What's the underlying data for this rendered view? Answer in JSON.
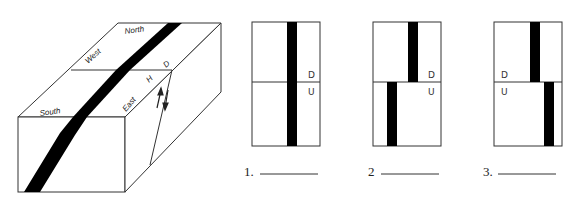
{
  "block_diagram": {
    "labels": {
      "north": "North",
      "west": "West",
      "south": "South",
      "east": "East",
      "fault_upper": "D",
      "fault_lower": "H"
    },
    "motion_arrows": [
      "up",
      "down"
    ]
  },
  "panels": [
    {
      "number": "1.",
      "top_label": "D",
      "bottom_label": "U",
      "label_side": "right",
      "offset": "none",
      "answer": ""
    },
    {
      "number": "2",
      "top_label": "D",
      "bottom_label": "U",
      "label_side": "right",
      "offset": "left",
      "answer": ""
    },
    {
      "number": "3.",
      "top_label": "D",
      "bottom_label": "U",
      "label_side": "left",
      "offset": "right",
      "answer": ""
    }
  ],
  "colors": {
    "stroke": "#333333",
    "bed": "#000000",
    "background": "#ffffff"
  }
}
